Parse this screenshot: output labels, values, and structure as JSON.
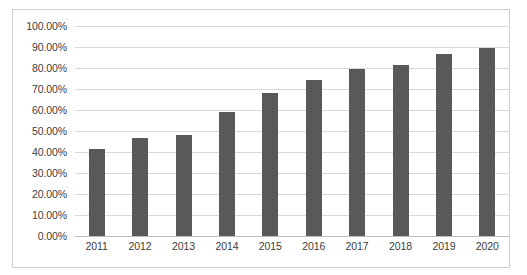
{
  "chart_data": {
    "type": "bar",
    "title": "",
    "xlabel": "",
    "ylabel": "",
    "categories": [
      "2011",
      "2012",
      "2013",
      "2014",
      "2015",
      "2016",
      "2017",
      "2018",
      "2019",
      "2020"
    ],
    "values": [
      41.5,
      46.5,
      48.0,
      59.0,
      68.0,
      74.5,
      79.5,
      81.5,
      86.5,
      89.5
    ],
    "value_labels": [
      "41.50%",
      "46.50%",
      "48.00%",
      "59.00%",
      "68.00%",
      "74.50%",
      "79.50%",
      "81.50%",
      "86.50%",
      "89.50%"
    ],
    "ylim": [
      0,
      100
    ],
    "ytick_values": [
      0,
      10,
      20,
      30,
      40,
      50,
      60,
      70,
      80,
      90,
      100
    ],
    "ytick_labels": [
      "0.00%",
      "10.00%",
      "20.00%",
      "30.00%",
      "40.00%",
      "50.00%",
      "60.00%",
      "70.00%",
      "80.00%",
      "90.00%",
      "100.00%"
    ],
    "grid": true,
    "legend": false,
    "legend_position": "none",
    "series": [
      {
        "name": "",
        "color": "#595959",
        "values": [
          41.5,
          46.5,
          48.0,
          59.0,
          68.0,
          74.5,
          79.5,
          81.5,
          86.5,
          89.5
        ]
      }
    ],
    "colors": {
      "bar": "#595959",
      "gridline": "#d9d9d9",
      "axis_line": "#bfbfbf",
      "frame_border": "#cfcfcf",
      "plot_background": "#ffffff",
      "tick_label": "#404040"
    }
  }
}
